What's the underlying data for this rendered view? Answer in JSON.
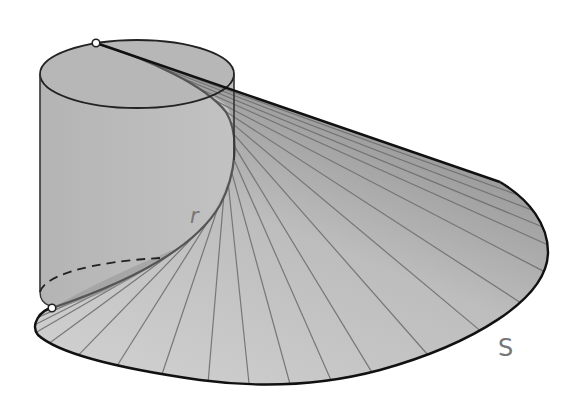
{
  "figure": {
    "labels": {
      "curve_label": "r",
      "surface_label": "S"
    },
    "points": [
      {
        "name": "top-point",
        "x": 96,
        "y": 43
      },
      {
        "name": "bottom-point",
        "x": 52,
        "y": 308
      }
    ],
    "colors": {
      "background": "#ffffff",
      "surface_light": "#cfcfcf",
      "surface_dark": "#8e8e8e",
      "cylinder": "#b9b9b9",
      "outline": "#111111",
      "ruling": "#6f6f6f",
      "label": "#777777"
    },
    "ruling_count": 22
  }
}
